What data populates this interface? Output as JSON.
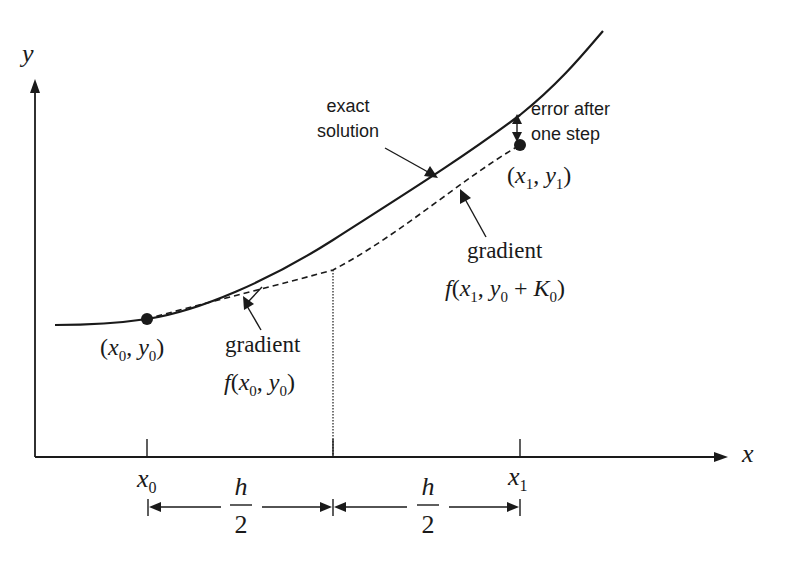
{
  "diagram": {
    "axes": {
      "x_label": "x",
      "y_label": "y"
    },
    "ticks": {
      "x0": {
        "var": "x",
        "sub": "0"
      },
      "x1": {
        "var": "x",
        "sub": "1"
      }
    },
    "step": {
      "left": {
        "num": "h",
        "den": "2"
      },
      "right": {
        "num": "h",
        "den": "2"
      }
    },
    "points": {
      "start": {
        "label_open": "(",
        "x": "x",
        "xsub": "0",
        "sep": ", ",
        "y": "y",
        "ysub": "0",
        "label_close": ")"
      },
      "end": {
        "label_open": "(",
        "x": "x",
        "xsub": "1",
        "sep": ", ",
        "y": "y",
        "ysub": "1",
        "label_close": ")"
      }
    },
    "annotations": {
      "exact_line1": "exact",
      "exact_line2": "solution",
      "error_line1": "error after",
      "error_line2": "one step",
      "gradient1_word": "gradient",
      "gradient1_f": "f",
      "gradient1_open": "(",
      "gradient1_x": "x",
      "gradient1_xsub": "0",
      "gradient1_sep": ", ",
      "gradient1_y": "y",
      "gradient1_ysub": "0",
      "gradient1_close": ")",
      "gradient2_word": "gradient",
      "gradient2_f": "f",
      "gradient2_open": "(",
      "gradient2_x": "x",
      "gradient2_xsub": "1",
      "gradient2_sep": ", ",
      "gradient2_y": "y",
      "gradient2_ysub": "0",
      "gradient2_plus": " + ",
      "gradient2_K": "K",
      "gradient2_Ksub": "0",
      "gradient2_close": ")"
    }
  }
}
